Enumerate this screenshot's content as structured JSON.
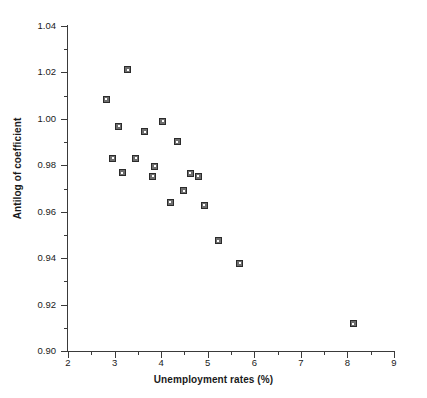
{
  "chart_data": {
    "type": "scatter",
    "title": "",
    "xlabel": "Unemployment rates (%)",
    "ylabel": "Antilog of coefficient",
    "xlim": [
      2,
      9
    ],
    "ylim": [
      0.9,
      1.04
    ],
    "grid": false,
    "legend": null,
    "x_ticks": [
      "2",
      "3",
      "4",
      "5",
      "6",
      "7",
      "8",
      "9"
    ],
    "x_tick_values": [
      2,
      3,
      4,
      5,
      6,
      7,
      8,
      9
    ],
    "x_minor_tick_values": [
      2.5,
      3.5,
      4.5,
      5.5,
      6.5,
      7.5,
      8.5
    ],
    "y_ticks": [
      "1.04",
      "1.02",
      "1.00",
      "0.98",
      "0.96",
      "0.94",
      "0.92",
      "0.90"
    ],
    "y_tick_values": [
      1.04,
      1.02,
      1.0,
      0.98,
      0.96,
      0.94,
      0.92,
      0.9
    ],
    "y_minor_tick_values": [
      1.03,
      1.01,
      0.99,
      0.97,
      0.95,
      0.93,
      0.91
    ],
    "marker": "square",
    "marker_fill_color": "#6e6e6e",
    "marker_edge_color": "#2b2b2b",
    "axis_color": "#3a3a3a",
    "background_color": "#ffffff",
    "points": [
      {
        "x": 2.82,
        "y": 1.0085
      },
      {
        "x": 3.28,
        "y": 1.0212
      },
      {
        "x": 3.09,
        "y": 0.9968
      },
      {
        "x": 3.65,
        "y": 0.9945
      },
      {
        "x": 4.03,
        "y": 0.999
      },
      {
        "x": 4.35,
        "y": 0.9902
      },
      {
        "x": 2.96,
        "y": 0.983
      },
      {
        "x": 3.45,
        "y": 0.983
      },
      {
        "x": 3.17,
        "y": 0.9768
      },
      {
        "x": 3.86,
        "y": 0.9795
      },
      {
        "x": 3.82,
        "y": 0.9753
      },
      {
        "x": 4.63,
        "y": 0.9765
      },
      {
        "x": 4.8,
        "y": 0.9753
      },
      {
        "x": 4.49,
        "y": 0.969
      },
      {
        "x": 4.2,
        "y": 0.9641
      },
      {
        "x": 4.93,
        "y": 0.9627
      },
      {
        "x": 5.23,
        "y": 0.9475
      },
      {
        "x": 5.69,
        "y": 0.9378
      },
      {
        "x": 8.13,
        "y": 0.9118
      }
    ]
  }
}
